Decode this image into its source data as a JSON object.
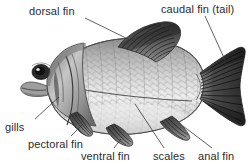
{
  "diagram": {
    "style": "grayscale pencil illustration",
    "background_color": "#ffffff",
    "label_color": "#2b2b2b",
    "leader_color": "#3a3a3a"
  },
  "labels": {
    "dorsal_fin": "dorsal fin",
    "caudal_fin": "caudal fin (tail)",
    "gills": "gills",
    "pectoral_fin": "pectoral fin",
    "ventral_fin": "ventral fin",
    "scales": "scales",
    "anal_fin": "anal fin"
  },
  "parts": [
    {
      "name": "dorsal fin",
      "label": "dorsal fin",
      "position": "top-center of body"
    },
    {
      "name": "caudal fin",
      "label": "caudal fin (tail)",
      "position": "rear, forked"
    },
    {
      "name": "gills",
      "label": "gills",
      "position": "behind head, left"
    },
    {
      "name": "pectoral fin",
      "label": "pectoral fin",
      "position": "lower side behind gills"
    },
    {
      "name": "ventral fin",
      "label": "ventral fin",
      "position": "underside mid-body"
    },
    {
      "name": "scales",
      "label": "scales",
      "position": "body surface"
    },
    {
      "name": "anal fin",
      "label": "anal fin",
      "position": "underside rear"
    }
  ],
  "colors": {
    "body_light": "#e8e8e8",
    "body_mid": "#b9b9b9",
    "body_dark": "#6f6f6f",
    "fin_dark": "#3b3b3b",
    "outline": "#4a4a4a"
  }
}
